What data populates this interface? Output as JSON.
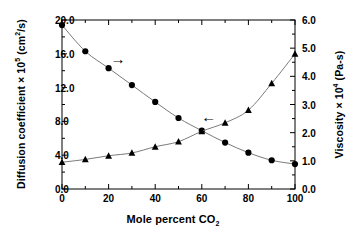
{
  "chart_data": {
    "type": "line",
    "title": "",
    "xlabel": "Mole percent CO2",
    "xlabel_parts": {
      "text": "Mole percent CO",
      "sub": "2"
    },
    "ylabel_left": "Diffusion coefficient × 105 (cm2/s)",
    "ylabel_left_parts": {
      "pre": "Diffusion coefficient × 10",
      "sup": "5",
      "mid": " (cm",
      "sup2": "2",
      "post": "/s)"
    },
    "ylabel_right": "Viscosity × 104 (Pa-s)",
    "ylabel_right_parts": {
      "pre": "Viscosity × 10",
      "sup": "4",
      "post": " (Pa-s)"
    },
    "x": [
      0,
      10,
      20,
      30,
      40,
      50,
      60,
      70,
      80,
      90,
      100
    ],
    "xlim": [
      0,
      100
    ],
    "xticks": [
      0,
      20,
      40,
      60,
      80,
      100
    ],
    "xtick_labels": [
      "0",
      "20",
      "40",
      "60",
      "80",
      "100"
    ],
    "xminor_ticks": [
      10,
      30,
      50,
      70,
      90
    ],
    "ylim_left": [
      0.0,
      20.0
    ],
    "yticks_left": [
      0.0,
      4.0,
      8.0,
      12.0,
      16.0,
      20.0
    ],
    "ytick_labels_left": [
      "0.0",
      "4.0",
      "8.0",
      "12.0",
      "16.0",
      "20.0"
    ],
    "yminor_left": [
      2.0,
      6.0,
      10.0,
      14.0,
      18.0
    ],
    "ylim_right": [
      0.0,
      6.0
    ],
    "yticks_right": [
      0.0,
      1.0,
      2.0,
      3.0,
      4.0,
      5.0,
      6.0
    ],
    "ytick_labels_right": [
      "0.0",
      "1.0",
      "2.0",
      "3.0",
      "4.0",
      "5.0",
      "6.0"
    ],
    "yminor_right": [
      0.5,
      1.5,
      2.5,
      3.5,
      4.5,
      5.5
    ],
    "grid": false,
    "legend": "none",
    "series": [
      {
        "name": "Diffusion coefficient",
        "axis": "left",
        "marker": "circle",
        "values": [
          19.4,
          16.3,
          14.3,
          12.3,
          10.3,
          8.4,
          6.9,
          5.5,
          4.3,
          3.4,
          2.95
        ]
      },
      {
        "name": "Viscosity",
        "axis": "right",
        "marker": "triangle",
        "values": [
          0.95,
          1.05,
          1.18,
          1.28,
          1.5,
          1.68,
          2.05,
          2.35,
          2.8,
          3.75,
          4.8
        ]
      }
    ],
    "annotations": [
      {
        "name": "arrow-to-left-axis",
        "symbol": "→",
        "x": 24,
        "y": 15.3
      },
      {
        "name": "arrow-to-right-axis",
        "symbol": "←",
        "x": 63,
        "y": 8.4
      }
    ]
  }
}
